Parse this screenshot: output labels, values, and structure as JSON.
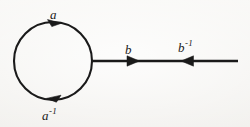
{
  "figure": {
    "background_color": "#f3f2ef",
    "stroke_color": "#1a1a1a",
    "labels": {
      "top_loop": {
        "base": "a",
        "sup": ""
      },
      "bottom_loop": {
        "base": "a",
        "sup": "-1"
      },
      "edge_left": {
        "base": "b",
        "sup": ""
      },
      "edge_right": {
        "base": "b",
        "sup": "-1"
      }
    },
    "geometry": {
      "circle": {
        "cx": 53,
        "cy": 61,
        "r": 39
      },
      "edge": {
        "x1": 92,
        "y1": 61,
        "x2": 238,
        "y2": 61
      },
      "arrow_top_loop": {
        "x": 60,
        "y": 23,
        "direction": "right"
      },
      "arrow_bottom_loop": {
        "x": 48,
        "y": 98,
        "direction": "left"
      },
      "arrow_edge_b": {
        "x": 138,
        "y": 61,
        "direction": "right"
      },
      "arrow_edge_b_inverse": {
        "x": 182,
        "y": 61,
        "direction": "left"
      }
    }
  }
}
